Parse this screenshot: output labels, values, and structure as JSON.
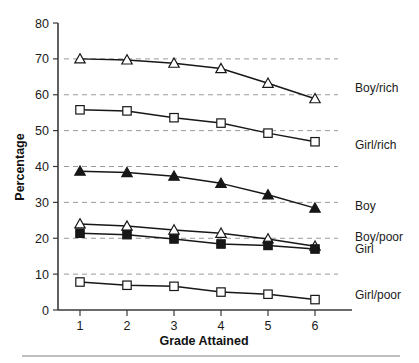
{
  "chart_data": {
    "type": "line",
    "title": "",
    "xlabel": "Grade Attained",
    "ylabel": "Percentage",
    "x": [
      1,
      2,
      3,
      4,
      5,
      6
    ],
    "categories": [
      "1",
      "2",
      "3",
      "4",
      "5",
      "6"
    ],
    "xlim": [
      0.6,
      6.6
    ],
    "ylim": [
      0,
      80
    ],
    "yticks": [
      0,
      10,
      20,
      30,
      40,
      50,
      60,
      70,
      80
    ],
    "ytick_labels": [
      "0",
      "10",
      "20",
      "30",
      "40",
      "50",
      "60",
      "70",
      "80"
    ],
    "xtick_labels": [
      "1",
      "2",
      "3",
      "4",
      "5",
      "6"
    ],
    "grid": "horizontal-dashed",
    "gridline_values": [
      10,
      20,
      30,
      40,
      50,
      60,
      70
    ],
    "legend_position": "right-inline",
    "series": [
      {
        "name": "Boy/rich",
        "marker": "open-triangle",
        "values": [
          70.0,
          69.7,
          68.8,
          67.3,
          63.2,
          58.9
        ],
        "label_y": 62.0
      },
      {
        "name": "Girl/rich",
        "marker": "open-square",
        "values": [
          55.8,
          55.5,
          53.6,
          52.1,
          49.3,
          46.9
        ],
        "label_y": 46.0
      },
      {
        "name": "Boy",
        "marker": "filled-triangle",
        "values": [
          38.7,
          38.3,
          37.3,
          35.3,
          32.1,
          28.4
        ],
        "label_y": 29.0
      },
      {
        "name": "Boy/poor",
        "marker": "open-triangle",
        "values": [
          24.0,
          23.4,
          22.3,
          21.4,
          19.8,
          17.8
        ],
        "label_y": 20.4
      },
      {
        "name": "Girl",
        "marker": "filled-square",
        "values": [
          21.4,
          21.0,
          19.8,
          18.4,
          18.0,
          17.0
        ],
        "label_y": 17.2
      },
      {
        "name": "Girl/poor",
        "marker": "open-square",
        "values": [
          7.8,
          6.9,
          6.6,
          5.0,
          4.4,
          2.9
        ],
        "label_y": 4.2
      }
    ],
    "colors": {
      "line": "#171717",
      "marker_fill_open": "#ffffff",
      "marker_fill_closed": "#171717",
      "marker_stroke": "#171717",
      "grid": "#9a9a9a",
      "axis": "#3a3a3a",
      "text": "#1a1a1a",
      "background": "#ffffff"
    }
  },
  "footer": {
    "rule": true
  }
}
